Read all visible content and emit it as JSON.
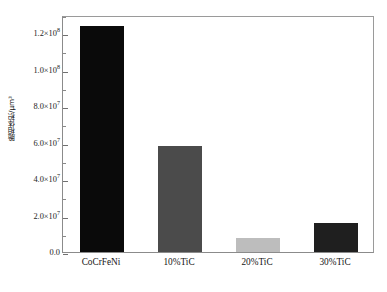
{
  "chart_data": {
    "type": "bar",
    "title": "",
    "xlabel": "",
    "ylabel": "脆相体积/μm³",
    "categories": [
      "CoCrFeNi",
      "10%TiC",
      "20%TiC",
      "30%TiC"
    ],
    "values": [
      124000000,
      58000000,
      7500000,
      16000000
    ],
    "value_labels": [
      "1.24×10⁸",
      "5.8×10⁷",
      "7.5×10⁶",
      "1.6×10⁷"
    ],
    "bar_colors": [
      "#0a0a0a",
      "#4b4b4b",
      "#bdbdbd",
      "#1f1f1f"
    ],
    "ylim": [
      0,
      130000000
    ],
    "grid": false,
    "legend": "none",
    "yticks": [
      {
        "value": 0,
        "mantissa": "0.0",
        "exponent": "",
        "label": "0.0"
      },
      {
        "value": 20000000,
        "mantissa": "2.0×10",
        "exponent": "7",
        "label": "2.0×10⁷"
      },
      {
        "value": 40000000,
        "mantissa": "4.0×10",
        "exponent": "7",
        "label": "4.0×10⁷"
      },
      {
        "value": 60000000,
        "mantissa": "6.0×10",
        "exponent": "7",
        "label": "6.0×10⁷"
      },
      {
        "value": 80000000,
        "mantissa": "8.0×10",
        "exponent": "7",
        "label": "8.0×10⁷"
      },
      {
        "value": 100000000,
        "mantissa": "1.0×10",
        "exponent": "8",
        "label": "1.0×10⁸"
      },
      {
        "value": 120000000,
        "mantissa": "1.2×10",
        "exponent": "8",
        "label": "1.2×10⁸"
      }
    ],
    "minor_ticks": [
      10000000,
      30000000,
      50000000,
      70000000,
      90000000,
      110000000,
      130000000
    ]
  },
  "caption": {
    "text": ""
  },
  "axis": {
    "frame_color": "#8b8b8b",
    "tick_color": "#707070",
    "background": "#ffffff"
  }
}
